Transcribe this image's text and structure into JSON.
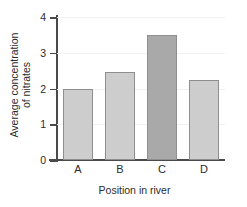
{
  "chart_data": {
    "type": "bar",
    "title": "",
    "subtitle": "",
    "xlabel": "Position in river",
    "ylabel": "Average concentration of nitrates",
    "ylabel_line1": "Average concentration",
    "ylabel_line2": "of nitrates",
    "categories": [
      "A",
      "B",
      "C",
      "D"
    ],
    "values": [
      2.0,
      2.45,
      3.5,
      2.25
    ],
    "series": [
      {
        "name": "Average concentration of nitrates",
        "values": [
          2.0,
          2.45,
          3.5,
          2.25
        ]
      }
    ],
    "bar_colors": [
      "#cdcdcd",
      "#cdcdcd",
      "#a9a9a9",
      "#cdcdcd"
    ],
    "bar_border_color": "#8e8e8e",
    "highlighted_category": "C",
    "ylim": [
      0,
      4
    ],
    "ytick_labels": [
      "0",
      "1",
      "2",
      "3",
      "4"
    ],
    "ytick_values": [
      0,
      1,
      2,
      3,
      4
    ],
    "xtick_labels": [
      "A",
      "B",
      "C",
      "D"
    ],
    "grid": true,
    "grid_color": "#f1f1f1",
    "axis_color": "#4a4a4a",
    "legend": false,
    "legend_position": "none",
    "annotations": []
  }
}
